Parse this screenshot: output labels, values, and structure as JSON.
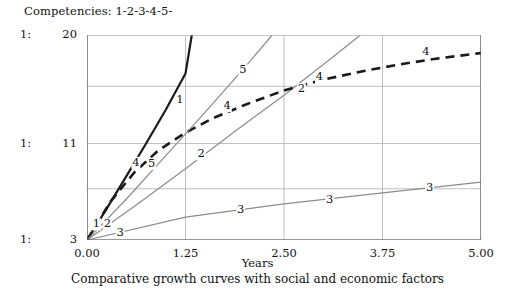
{
  "legend": {
    "header": "Competencies: 1-2-3-4-5-"
  },
  "axes": {
    "y_ticks": [
      {
        "value": "20",
        "ratio": "1:",
        "y": 20
      },
      {
        "value": "11",
        "ratio": "1:",
        "y": 11
      },
      {
        "value": "3",
        "ratio": "1:",
        "y": 3
      }
    ],
    "x_ticks": [
      "0.00",
      "1.25",
      "2.50",
      "3.75",
      "5.00"
    ],
    "x_title": "Years"
  },
  "caption": "Comparative growth curves with social and economic factors",
  "colors": {
    "curve_dark": "#1a1a1a",
    "curve_gray": "#8c8c8c",
    "gridline": "#b0b0b0",
    "axis": "#555555",
    "background": "#ffffff"
  },
  "chart_data": {
    "type": "line",
    "title": "Comparative growth curves with social and economic factors",
    "xlabel": "Years",
    "ylabel": "",
    "xlim": [
      0.0,
      5.0
    ],
    "ylim": [
      3,
      20
    ],
    "grid": true,
    "legend_position": "inline-labels",
    "xticks": [
      0.0,
      1.25,
      2.5,
      3.75,
      5.0
    ],
    "yticks": [
      3,
      7.25,
      11,
      15.75,
      20
    ],
    "series": [
      {
        "name": "1",
        "style": "solid",
        "color": "#1a1a1a",
        "width": 2.2,
        "label_points": [
          {
            "x": 0.12,
            "y": 4.3
          },
          {
            "x": 1.18,
            "y": 14.6
          }
        ],
        "x": [
          0.0,
          0.25,
          0.5,
          0.75,
          1.0,
          1.25,
          1.33
        ],
        "y": [
          3.0,
          5.6,
          8.3,
          11.0,
          13.8,
          16.8,
          20.0
        ]
      },
      {
        "name": "2",
        "style": "solid",
        "color": "#8c8c8c",
        "width": 1.2,
        "label_points": [
          {
            "x": 0.26,
            "y": 4.3
          },
          {
            "x": 1.45,
            "y": 10.1
          },
          {
            "x": 2.72,
            "y": 15.5
          }
        ],
        "x": [
          0.0,
          0.625,
          1.25,
          1.875,
          2.5,
          3.125,
          3.47
        ],
        "y": [
          3.0,
          5.9,
          8.9,
          12.0,
          15.0,
          18.2,
          20.0
        ]
      },
      {
        "name": "3",
        "style": "solid",
        "color": "#8c8c8c",
        "width": 1.2,
        "label_points": [
          {
            "x": 0.42,
            "y": 3.55
          },
          {
            "x": 1.95,
            "y": 5.5
          },
          {
            "x": 3.08,
            "y": 6.35
          },
          {
            "x": 4.35,
            "y": 7.35
          }
        ],
        "x": [
          0.0,
          1.25,
          2.5,
          3.75,
          5.0
        ],
        "y": [
          3.0,
          4.9,
          6.0,
          6.9,
          7.8
        ]
      },
      {
        "name": "4",
        "style": "dashed",
        "color": "#1a1a1a",
        "width": 2.6,
        "label_points": [
          {
            "x": 0.62,
            "y": 9.4
          },
          {
            "x": 1.78,
            "y": 14.1
          },
          {
            "x": 2.95,
            "y": 16.5
          },
          {
            "x": 4.3,
            "y": 18.6
          }
        ],
        "x": [
          0.0,
          0.3,
          0.6,
          0.9,
          1.25,
          1.6,
          2.0,
          2.5,
          3.0,
          3.5,
          4.0,
          4.5,
          5.0
        ],
        "y": [
          3.0,
          6.2,
          8.6,
          10.4,
          11.9,
          13.1,
          14.2,
          15.4,
          16.3,
          17.0,
          17.6,
          18.1,
          18.5
        ]
      },
      {
        "name": "5",
        "style": "solid",
        "color": "#8c8c8c",
        "width": 1.2,
        "label_points": [
          {
            "x": 0.82,
            "y": 9.3
          },
          {
            "x": 1.98,
            "y": 17.1
          }
        ],
        "x": [
          0.0,
          0.5,
          1.0,
          1.5,
          2.0,
          2.35
        ],
        "y": [
          3.0,
          6.4,
          10.0,
          13.6,
          17.3,
          20.0
        ]
      }
    ]
  }
}
